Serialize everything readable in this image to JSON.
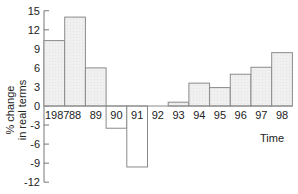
{
  "chart_data": {
    "type": "bar",
    "title": "",
    "xlabel": "Time",
    "ylabel": "% change in real terms",
    "ylabel_lines": [
      "% change",
      "in real terms"
    ],
    "categories": [
      "1987",
      "88",
      "89",
      "90",
      "91",
      "92",
      "93",
      "94",
      "95",
      "96",
      "97",
      "98"
    ],
    "values": [
      10.3,
      14,
      6,
      -3.5,
      -9.6,
      0,
      0.6,
      3.6,
      2.9,
      5,
      6.1,
      8.4
    ],
    "ylim": [
      -12,
      15
    ],
    "yticks": [
      15,
      12,
      9,
      6,
      3,
      0,
      -3,
      -6,
      -9,
      -12
    ],
    "grid": false,
    "legend": null
  },
  "colors": {
    "positive_fill": "#efefef",
    "negative_fill": "#ffffff",
    "bar_stroke": "#8a8a8a",
    "axis": "#777777",
    "text": "#222222"
  }
}
